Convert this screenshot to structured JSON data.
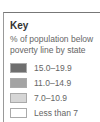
{
  "key": {
    "title": "Key",
    "description": "% of population below poverty line by state",
    "items": [
      {
        "label": "15.0–19.9",
        "color": "#6e6e6e"
      },
      {
        "label": "11.0–14.9",
        "color": "#a3a3a3"
      },
      {
        "label": "7.0–10.9",
        "color": "#d6d6d6"
      },
      {
        "label": "Less than 7",
        "color": "#ffffff"
      }
    ]
  }
}
